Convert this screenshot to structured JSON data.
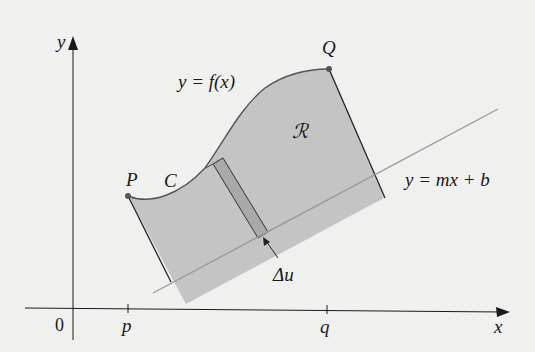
{
  "figure": {
    "type": "area-between-curve-and-line",
    "colors": {
      "background": "#f0f0ee",
      "region_fill": "#c4c4c4",
      "strip_fill": "#a9a9a9",
      "line_color": "#9a9a9a",
      "axis_color": "#1a1a1a",
      "point_color": "#555555"
    },
    "axes": {
      "x_label": "x",
      "y_label": "y",
      "origin_label": "0",
      "ticks": [
        {
          "label": "p"
        },
        {
          "label": "q"
        }
      ]
    },
    "labels": {
      "curve_equation": "y = f(x)",
      "line_equation": "y = mx + b",
      "region": "ℛ",
      "curve_name": "C",
      "point_start": "P",
      "point_end": "Q",
      "strip_width": "Δu"
    }
  }
}
